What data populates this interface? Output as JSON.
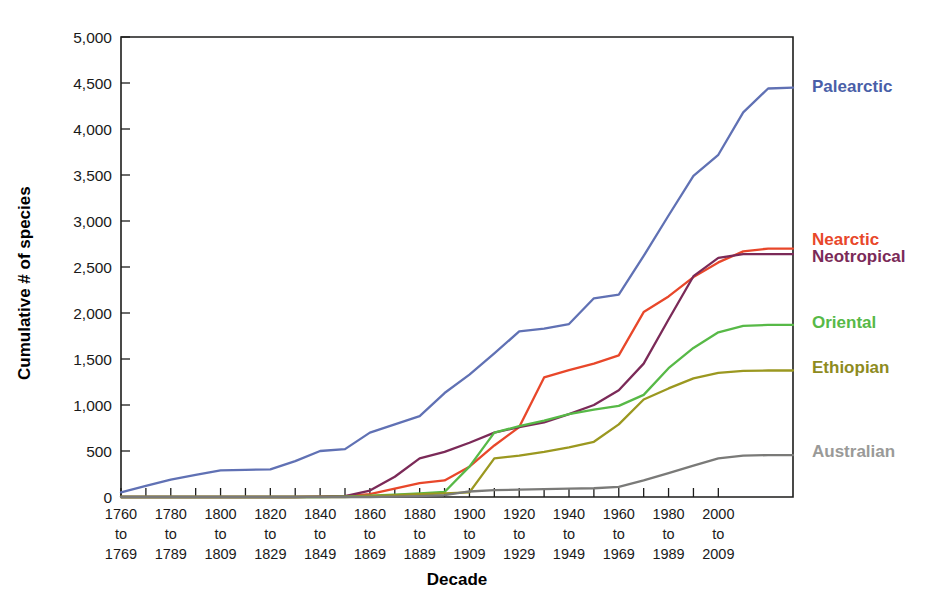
{
  "chart_data": {
    "type": "line",
    "title": "",
    "xlabel": "Decade",
    "ylabel": "Cumulative # of species",
    "ylim": [
      0,
      5000
    ],
    "ytick_values": [
      0,
      500,
      1000,
      1500,
      2000,
      2500,
      3000,
      3500,
      4000,
      4500,
      5000
    ],
    "ytick_labels": [
      "0",
      "500",
      "1,000",
      "1,500",
      "2,000",
      "2,500",
      "3,000",
      "3,500",
      "4,000",
      "4,500",
      "5,000"
    ],
    "grid": false,
    "legend_position": "right-inline-labels",
    "x_decade_starts": [
      1760,
      1770,
      1780,
      1790,
      1800,
      1810,
      1820,
      1830,
      1840,
      1850,
      1860,
      1870,
      1880,
      1890,
      1900,
      1910,
      1920,
      1930,
      1940,
      1950,
      1960,
      1970,
      1980,
      1990,
      2000
    ],
    "x_labeled_ticks": [
      {
        "start": 1760,
        "mid": "to",
        "end": 1769
      },
      {
        "start": 1780,
        "mid": "to",
        "end": 1789
      },
      {
        "start": 1800,
        "mid": "to",
        "end": 1809
      },
      {
        "start": 1820,
        "mid": "to",
        "end": 1829
      },
      {
        "start": 1840,
        "mid": "to",
        "end": 1849
      },
      {
        "start": 1860,
        "mid": "to",
        "end": 1869
      },
      {
        "start": 1880,
        "mid": "to",
        "end": 1889
      },
      {
        "start": 1900,
        "mid": "to",
        "end": 1909
      },
      {
        "start": 1920,
        "mid": "to",
        "end": 1929
      },
      {
        "start": 1940,
        "mid": "to",
        "end": 1949
      },
      {
        "start": 1960,
        "mid": "to",
        "end": 1969
      },
      {
        "start": 1980,
        "mid": "to",
        "end": 1989
      },
      {
        "start": 2000,
        "mid": "to",
        "end": 2009
      }
    ],
    "series": [
      {
        "name": "Palearctic",
        "color": "#6071b4",
        "label_color": "#4a5fa8",
        "values": [
          50,
          120,
          190,
          240,
          290,
          295,
          300,
          390,
          500,
          520,
          700,
          790,
          880,
          1130,
          1330,
          1560,
          1800,
          1830,
          1880,
          2160,
          2200,
          2620,
          3060,
          3490,
          3720,
          4180,
          4440,
          4450
        ]
      },
      {
        "name": "Nearctic",
        "color": "#e8472a",
        "label_color": "#e8472a",
        "values": [
          0,
          0,
          0,
          0,
          0,
          0,
          0,
          0,
          5,
          10,
          30,
          90,
          150,
          180,
          330,
          560,
          760,
          1300,
          1380,
          1450,
          1540,
          2010,
          2180,
          2390,
          2550,
          2670,
          2700,
          2700
        ]
      },
      {
        "name": "Neotropical",
        "color": "#7b2a58",
        "label_color": "#7b2a58",
        "values": [
          0,
          0,
          0,
          0,
          0,
          0,
          0,
          0,
          5,
          10,
          70,
          220,
          420,
          490,
          590,
          700,
          760,
          810,
          900,
          1000,
          1160,
          1450,
          1930,
          2400,
          2600,
          2640,
          2640,
          2640
        ]
      },
      {
        "name": "Oriental",
        "color": "#57b947",
        "label_color": "#57b947",
        "values": [
          0,
          0,
          0,
          0,
          0,
          0,
          0,
          0,
          0,
          5,
          15,
          25,
          40,
          55,
          330,
          700,
          770,
          830,
          900,
          950,
          990,
          1110,
          1400,
          1620,
          1790,
          1860,
          1870,
          1870
        ]
      },
      {
        "name": "Ethiopian",
        "color": "#9b9820",
        "label_color": "#8e8b1e",
        "values": [
          0,
          0,
          0,
          0,
          0,
          0,
          0,
          0,
          0,
          0,
          10,
          20,
          30,
          40,
          50,
          420,
          450,
          490,
          540,
          600,
          790,
          1060,
          1180,
          1290,
          1350,
          1370,
          1375,
          1375
        ]
      },
      {
        "name": "Australian",
        "color": "#7a7a78",
        "label_color": "#9a9a98",
        "values": [
          0,
          0,
          0,
          0,
          0,
          0,
          0,
          0,
          0,
          0,
          0,
          5,
          10,
          20,
          60,
          75,
          80,
          85,
          90,
          95,
          110,
          180,
          260,
          340,
          420,
          450,
          455,
          455
        ]
      }
    ],
    "series_label_y_values": [
      4450,
      2790,
      2600,
      1890,
      1400,
      480
    ],
    "annotations": []
  },
  "figure": {
    "plot_box": {
      "left": 121,
      "top": 37,
      "right": 793,
      "bottom": 497
    },
    "xaxis_first_value": 1760,
    "xaxis_last_value": 2030,
    "ytick_count": 11
  }
}
